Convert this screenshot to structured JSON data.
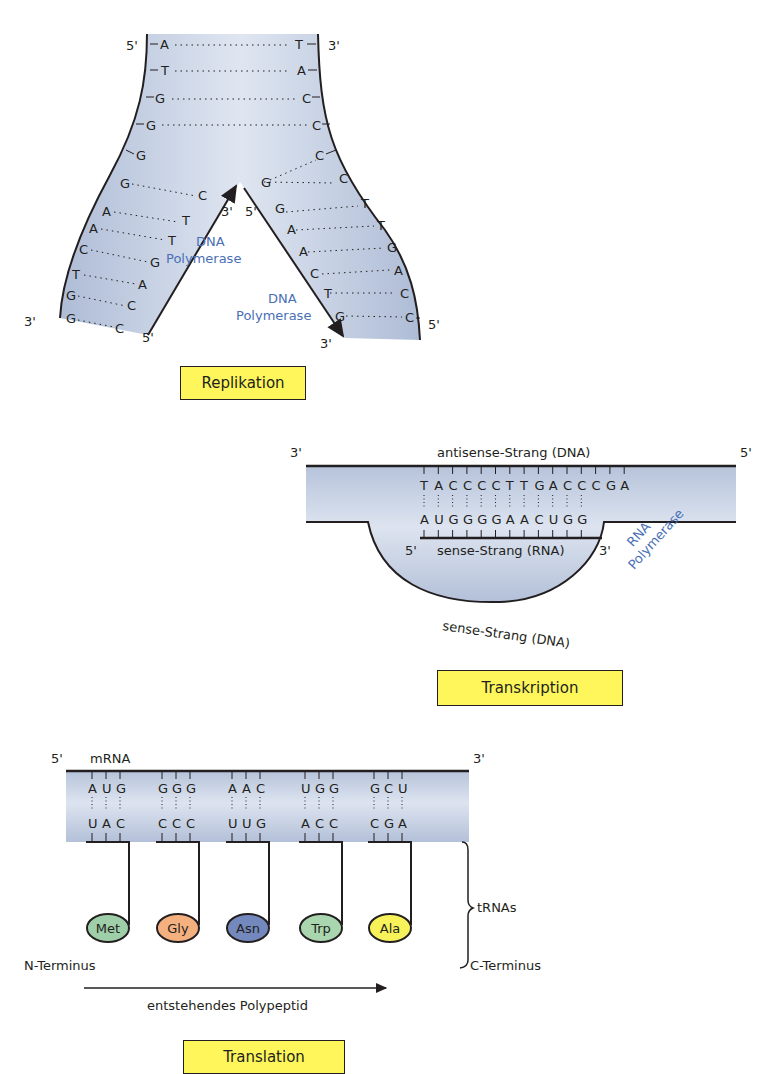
{
  "colors": {
    "strand_fill": "#b9c6dd",
    "strand_fill_light": "#e3e9f3",
    "polymerase_blue": "#4a6fb5",
    "label_box_fill": "#fef65b",
    "outline": "#231f20"
  },
  "replication": {
    "title": "Replikation",
    "top_left_end": "5'",
    "top_right_end": "3'",
    "bottom_left_end": "3'",
    "bottom_left_inner_end": "5'",
    "bottom_right_end": "5'",
    "bottom_right_inner_end": "3'",
    "fork_left_end": "3'",
    "fork_right_end": "5'",
    "parental_left": [
      "A",
      "T",
      "G",
      "G"
    ],
    "parental_right": [
      "T",
      "A",
      "C",
      "C"
    ],
    "left_arm_template": [
      "G",
      "G",
      "A",
      "A",
      "C",
      "T",
      "G",
      "G"
    ],
    "left_arm_new": [
      "C",
      "T",
      "T",
      "G",
      "A",
      "C",
      "C"
    ],
    "right_arm_template": [
      "C",
      "C",
      "T",
      "T",
      "G",
      "A",
      "C",
      "C"
    ],
    "right_arm_new": [
      "G",
      "G",
      "A",
      "A",
      "C",
      "T",
      "G"
    ],
    "polymerase_left": [
      "DNA",
      "Polymerase"
    ],
    "polymerase_right": [
      "DNA",
      "Polymerase"
    ]
  },
  "transcription": {
    "title": "Transkription",
    "left_end": "3'",
    "right_end": "5'",
    "antisense_label": "antisense-Strang (DNA)",
    "antisense_seq": [
      "T",
      "A",
      "C",
      "C",
      "C",
      "C",
      "T",
      "T",
      "G",
      "A",
      "C",
      "C",
      "C",
      "G",
      "A"
    ],
    "rna_seq": [
      "A",
      "U",
      "G",
      "G",
      "G",
      "G",
      "A",
      "A",
      "C",
      "U",
      "G",
      "G"
    ],
    "rna_5": "5'",
    "rna_3": "3'",
    "rna_label": "sense-Strang (RNA)",
    "sense_dna_label": "sense-Strang (DNA)",
    "polymerase": [
      "RNA",
      "Polymerase"
    ]
  },
  "translation": {
    "title": "Translation",
    "mrna_5": "5'",
    "mrna_label": "mRNA",
    "mrna_3": "3'",
    "codons": [
      "AUG",
      "GGG",
      "AAC",
      "UGG",
      "GCU"
    ],
    "anticodons": [
      "UAC",
      "CCC",
      "UUG",
      "ACC",
      "CGA"
    ],
    "amino_acids": [
      {
        "name": "Met",
        "color": "#9fcfa8"
      },
      {
        "name": "Gly",
        "color": "#f5b07f"
      },
      {
        "name": "Asn",
        "color": "#7388bd"
      },
      {
        "name": "Trp",
        "color": "#a9d6ae"
      },
      {
        "name": "Ala",
        "color": "#f7f25a"
      }
    ],
    "trna_label": "tRNAs",
    "n_terminus": "N-Terminus",
    "c_terminus": "C-Terminus",
    "polypeptide_label": "entstehendes Polypeptid"
  }
}
